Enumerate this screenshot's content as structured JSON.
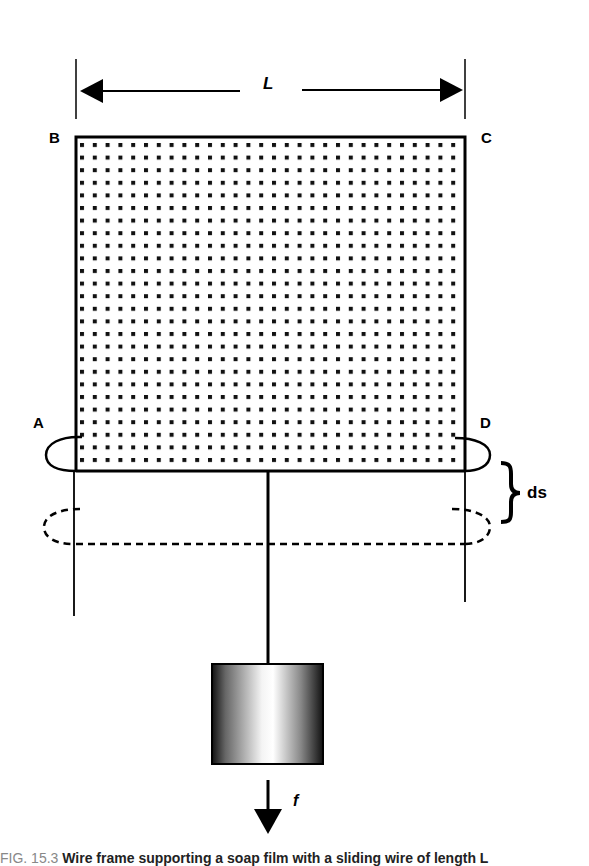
{
  "diagram": {
    "labels": {
      "length": "L",
      "corner_top_left": "B",
      "corner_top_right": "C",
      "corner_bottom_left": "A",
      "corner_bottom_right": "D",
      "displacement": "ds",
      "force": "f"
    },
    "colors": {
      "stroke": "#000000",
      "background": "#ffffff",
      "weight_shade_dark": "#1a1a1a",
      "weight_shade_light": "#ffffff"
    },
    "film_grid": {
      "columns": 30,
      "rows": 25
    }
  },
  "caption": {
    "figure": "FIG. 15.3",
    "text": "Wire frame supporting a soap film with a sliding wire of length L"
  }
}
